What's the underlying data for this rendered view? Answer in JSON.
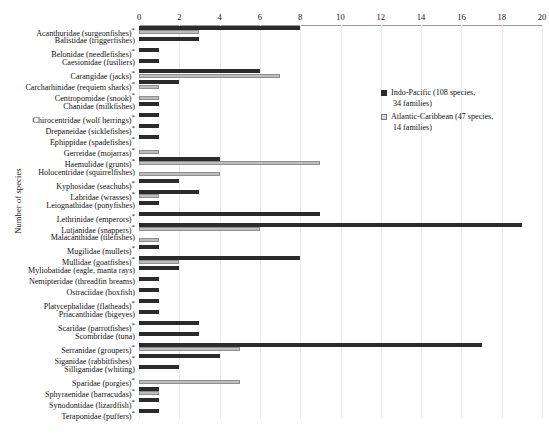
{
  "chart_data": {
    "type": "bar",
    "orientation": "horizontal",
    "title": "",
    "xlabel": "",
    "ylabel": "Number of species",
    "xlim": [
      0,
      20
    ],
    "xticks": [
      0,
      2,
      4,
      6,
      8,
      10,
      12,
      14,
      16,
      18,
      20
    ],
    "grid": true,
    "legend_position": "top-right",
    "categories": [
      "Acanthuridae (surgeonfishes)*",
      "Balistidae (triggerfishes)",
      "Belonidae (needlefishes)*",
      "Caesionidae (fusiliers)",
      "Carangidae (jacks)*",
      "Carcharhinidae (requiem sharks)*",
      "Centropomidae (snook)*",
      "Chanidae (milkfishes)",
      "Chirocentridae (wolf herrings)*",
      "Drepaneidae (sicklefishes)*",
      "Ephippidae (spadefishes)*",
      "Gerreidae (mojarras)*",
      "Haemulidae (grunts)*",
      "Holocentridae (squirrelfishes)",
      "Kyphosidae (seachubs)*",
      "Labridae (wrasses)*",
      "Leiognathidae (ponyfishes)",
      "Lethrinidae (emperors)*",
      "Lutjanidae (snappers)*",
      "Malacanthidae (tilefishes)",
      "Mugilidae (mullets)*",
      "Mullidae (goatfishes)*",
      "Myliobatidae (eagle, manta rays)",
      "Nemipteridae (threadfin breams)",
      "Ostraciidae (boxfish)",
      "Platycephalidae (flatheads)*",
      "Priacanthidae (bigeyes)",
      "Scaridae (parrotfishes)*",
      "Scombridae (tuna)",
      "Serranidae (groupers)*",
      "Siganidae (rabbitfishes)*",
      "Silliganidae (whiting)",
      "Sparidae (porgies)*",
      "Sphyraenidae (barracudas)*",
      "Synodontidae (lizardfish)*",
      "Teraponidae (puffers)*"
    ],
    "series": [
      {
        "name": "Indo-Pacific (108 species, 34 families)",
        "color": "#2b2b2b",
        "values": [
          8,
          3,
          1,
          1,
          6,
          2,
          0,
          1,
          1,
          1,
          1,
          0,
          4,
          0,
          2,
          3,
          1,
          9,
          19,
          0,
          1,
          8,
          2,
          1,
          1,
          1,
          1,
          3,
          3,
          17,
          4,
          2,
          0,
          1,
          1,
          1
        ]
      },
      {
        "name": "Atlantic-Caribbean (47 species, 14 families)",
        "color": "#bdbdbd",
        "values": [
          3,
          0,
          0,
          0,
          7,
          1,
          1,
          0,
          0,
          0,
          0,
          1,
          9,
          4,
          0,
          1,
          0,
          0,
          6,
          1,
          0,
          2,
          0,
          0,
          0,
          0,
          0,
          0,
          0,
          5,
          0,
          0,
          5,
          1,
          0,
          0
        ]
      }
    ]
  },
  "legend": {
    "items": [
      {
        "line1": "Indo-Pacific (108 species,",
        "line2": "34 families)"
      },
      {
        "line1": "Atlantic-Caribbean (47 species,",
        "line2": "14 families)"
      }
    ]
  },
  "axis": {
    "y_title": "Number of species"
  }
}
